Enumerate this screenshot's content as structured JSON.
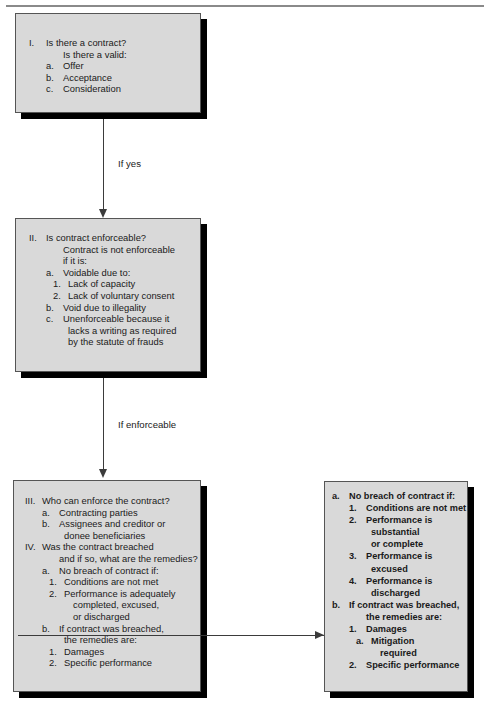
{
  "diagram": {
    "colors": {
      "box_fill": "#d9d9d9",
      "box_border": "#555555",
      "shadow": "#000000",
      "connector": "#3b3b3b",
      "rule": "#8a8a8a"
    },
    "nodes": [
      {
        "id": "node-1",
        "name": "is-there-a-contract",
        "bold": false,
        "lines": [
          {
            "marker": "I.",
            "text": "Is there a contract?",
            "indent": 0
          },
          {
            "marker": "",
            "text": "Is there a valid:",
            "indent": 1
          },
          {
            "marker": "a.",
            "text": "Offer",
            "indent": 1
          },
          {
            "marker": "b.",
            "text": "Acceptance",
            "indent": 1
          },
          {
            "marker": "c.",
            "text": "Consideration",
            "indent": 1
          }
        ]
      },
      {
        "id": "node-2",
        "name": "is-contract-enforceable",
        "bold": false,
        "lines": [
          {
            "marker": "II.",
            "text": "Is contract enforceable?",
            "indent": 0
          },
          {
            "marker": "",
            "text": "Contract is not enforceable",
            "indent": 1
          },
          {
            "marker": "",
            "text": "if it is:",
            "indent": 1
          },
          {
            "marker": "a.",
            "text": "Voidable due to:",
            "indent": 1
          },
          {
            "marker": "1.",
            "text": "Lack of capacity",
            "indent": 2
          },
          {
            "marker": "2.",
            "text": "Lack of voluntary consent",
            "indent": 2
          },
          {
            "marker": "b.",
            "text": "Void due to illegality",
            "indent": 1
          },
          {
            "marker": "c.",
            "text": "Unenforceable because it",
            "indent": 1
          },
          {
            "marker": "",
            "text": "lacks a writing as required",
            "indent": 2
          },
          {
            "marker": "",
            "text": "by the statute of frauds",
            "indent": 2
          }
        ]
      },
      {
        "id": "node-3",
        "name": "who-can-enforce-and-breach",
        "bold": false,
        "lines": [
          {
            "marker": "III.",
            "text": "Who can enforce the contract?",
            "indent": 0
          },
          {
            "marker": "a.",
            "text": "Contracting parties",
            "indent": 1
          },
          {
            "marker": "b.",
            "text": "Assignees and creditor or",
            "indent": 1
          },
          {
            "marker": "",
            "text": "donee beneficiaries",
            "indent": 2
          },
          {
            "marker": "IV.",
            "text": "Was the contract breached",
            "indent": 0
          },
          {
            "marker": "",
            "text": "and if so, what are the remedies?",
            "indent": 1
          },
          {
            "marker": "a.",
            "text": "No breach of contract if:",
            "indent": 1
          },
          {
            "marker": "1.",
            "text": "Conditions are not met",
            "indent": 2
          },
          {
            "marker": "2.",
            "text": "Performance is adequately",
            "indent": 2
          },
          {
            "marker": "",
            "text": "completed, excused,",
            "indent": 3
          },
          {
            "marker": "",
            "text": "or discharged",
            "indent": 3
          },
          {
            "marker": "b.",
            "text": "If contract was breached,",
            "indent": 1
          },
          {
            "marker": "",
            "text": "the remedies are:",
            "indent": 2
          },
          {
            "marker": "1.",
            "text": "Damages",
            "indent": 2
          },
          {
            "marker": "2.",
            "text": "Specific performance",
            "indent": 2
          }
        ]
      },
      {
        "id": "node-4",
        "name": "remedies-detail",
        "bold": true,
        "lines": [
          {
            "marker": "a.",
            "text": "No breach of contract if:",
            "indent": 0
          },
          {
            "marker": "1.",
            "text": "Conditions are not met",
            "indent": 1
          },
          {
            "marker": "2.",
            "text": "Performance is",
            "indent": 1
          },
          {
            "marker": "",
            "text": "substantial",
            "indent": 2
          },
          {
            "marker": "",
            "text": "or complete",
            "indent": 2
          },
          {
            "marker": "3.",
            "text": "Performance is",
            "indent": 1
          },
          {
            "marker": "",
            "text": "excused",
            "indent": 2
          },
          {
            "marker": "4.",
            "text": "Performance is",
            "indent": 1
          },
          {
            "marker": "",
            "text": "discharged",
            "indent": 2
          },
          {
            "marker": "b.",
            "text": "If contract was breached,",
            "indent": 0
          },
          {
            "marker": "",
            "text": "the remedies are:",
            "indent": 1
          },
          {
            "marker": "1.",
            "text": "Damages",
            "indent": 1
          },
          {
            "marker": "a.",
            "text": "Mitigation",
            "indent": 2
          },
          {
            "marker": "",
            "text": "required",
            "indent": 3
          },
          {
            "marker": "2.",
            "text": "Specific performance",
            "indent": 1
          }
        ]
      }
    ],
    "edges": [
      {
        "id": "edge1",
        "name": "edge-contract-to-enforceable",
        "label": "If yes"
      },
      {
        "id": "edge2",
        "name": "edge-enforceable-to-remedies",
        "label": "If enforceable"
      },
      {
        "id": "edge3",
        "name": "edge-breached-to-detail",
        "label": ""
      }
    ]
  }
}
